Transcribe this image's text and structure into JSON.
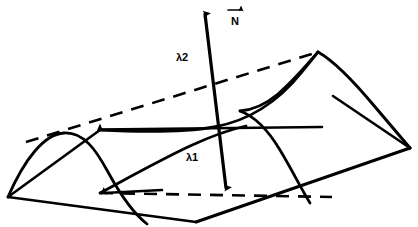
{
  "figure": {
    "background_color": "#ffffff",
    "stroke_color": "#000000",
    "width": 418,
    "height": 227,
    "labels": {
      "lambda2": "λ2",
      "lambda1": "λ1",
      "normal_vector": "N"
    },
    "annotations": [
      {
        "name": "lambda2-label",
        "text": "λ2",
        "x": 182,
        "y": 58,
        "description": "wavelength along the vertical/diagonal direction"
      },
      {
        "name": "lambda1-label",
        "text": "λ1",
        "x": 192,
        "y": 158,
        "description": "wavelength along the horizontal in-plane direction"
      },
      {
        "name": "normal-vector-label",
        "text": "N",
        "x": 235,
        "y": 20,
        "description": "surface normal vector N with overbar arrow"
      }
    ],
    "geometry": {
      "vertical_axis": {
        "name": "vertical-normal-axis",
        "top": [
          204,
          4
        ],
        "bottom": [
          227,
          196
        ],
        "arrow_top": "up",
        "arrow_bottom": "down"
      },
      "horizontal_axis": {
        "name": "horizontal-lambda1-axis",
        "left": [
          92,
          130
        ],
        "right": [
          320,
          128
        ],
        "arrow_left": "left"
      },
      "base_quad": [
        [
          8,
          197
        ],
        [
          100,
          130
        ],
        [
          410,
          148
        ],
        [
          318,
          205
        ]
      ],
      "peak_point": [
        318,
        52
      ],
      "left_hump_apex": [
        62,
        133
      ],
      "dashed_diagonal": [
        [
          26,
          142
        ],
        [
          318,
          52
        ]
      ],
      "dashed_baseline": [
        [
          100,
          192
        ],
        [
          330,
          196
        ]
      ]
    }
  }
}
